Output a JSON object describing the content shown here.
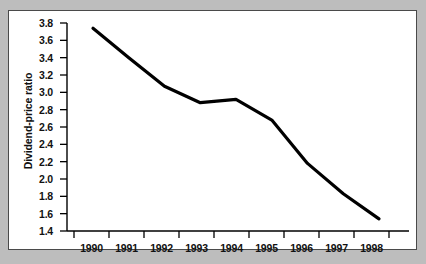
{
  "figure": {
    "background_color": "#bdbdbd",
    "card_color": "#ffffff",
    "border_color": "#4a4a4a",
    "line_color": "#000000"
  },
  "chart_data": {
    "type": "line",
    "title": "",
    "xlabel": "",
    "ylabel": "Dividend-price ratio",
    "x": [
      1990,
      1991,
      1992,
      1993,
      1994,
      1995,
      1996,
      1997,
      1998
    ],
    "categories": [
      "1990",
      "1991",
      "1992",
      "1993",
      "1994",
      "1995",
      "1996",
      "1997",
      "1998"
    ],
    "values": [
      3.74,
      3.4,
      3.07,
      2.88,
      2.92,
      2.68,
      2.18,
      1.83,
      1.54
    ],
    "series": [
      {
        "name": "Dividend-price ratio",
        "values": [
          3.74,
          3.4,
          3.07,
          2.88,
          2.92,
          2.68,
          2.18,
          1.83,
          1.54
        ]
      }
    ],
    "ylim": [
      1.4,
      3.8
    ],
    "xlim": [
      1990,
      1998
    ],
    "ytick_labels": [
      "3.8",
      "3.6",
      "3.4",
      "3.2",
      "3.0",
      "2.8",
      "2.6",
      "2.4",
      "2.2",
      "2.0",
      "1.8",
      "1.6",
      "1.4"
    ],
    "ytick_values": [
      3.8,
      3.6,
      3.4,
      3.2,
      3.0,
      2.8,
      2.6,
      2.4,
      2.2,
      2.0,
      1.8,
      1.6,
      1.4
    ],
    "xtick_labels": [
      "1990",
      "1991",
      "1992",
      "1993",
      "1994",
      "1995",
      "1996",
      "1997",
      "1998"
    ],
    "grid": false,
    "legend": false,
    "legend_position": "none",
    "annotations": []
  }
}
